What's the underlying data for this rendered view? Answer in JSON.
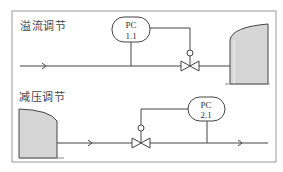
{
  "sections": [
    {
      "title": "溢流调节",
      "controller": {
        "tag": "PC",
        "loop": "1.1"
      }
    },
    {
      "title": "减压调节",
      "controller": {
        "tag": "PC",
        "loop": "2.1"
      }
    }
  ],
  "colors": {
    "line": "#444444",
    "tank_fill": "#d6d6d6",
    "frame": "#999999"
  }
}
